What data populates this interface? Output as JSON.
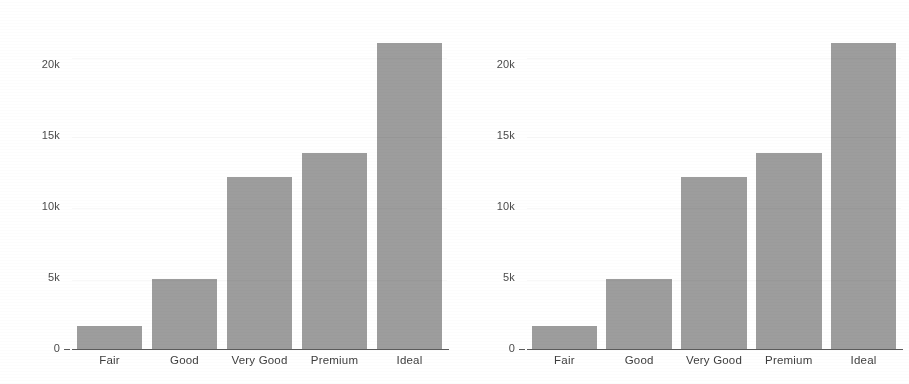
{
  "figure": {
    "background_color": "#ffffff",
    "bar_color": "#9d9d9d",
    "axis_color": "#5a5a5a",
    "text_color": "#3d3d3d",
    "panel_count": 2
  },
  "chart_data": [
    {
      "type": "bar",
      "title": "",
      "subtitle": "",
      "xlabel": "",
      "ylabel": "",
      "categories": [
        "Fair",
        "Good",
        "Very Good",
        "Premium",
        "Ideal"
      ],
      "values": [
        1610,
        4900,
        12100,
        13790,
        21550
      ],
      "series": [
        {
          "name": "count",
          "values": [
            1610,
            4900,
            12100,
            13790,
            21550
          ]
        }
      ],
      "ylim": [
        0,
        23000
      ],
      "yticks": [
        0,
        5000,
        10000,
        15000,
        20000
      ],
      "ytick_labels": [
        "0",
        "5k",
        "10k",
        "15k",
        "20k"
      ],
      "grid": false,
      "legend": "none",
      "orientation": "vertical"
    },
    {
      "type": "bar",
      "title": "",
      "subtitle": "",
      "xlabel": "",
      "ylabel": "",
      "categories": [
        "Fair",
        "Good",
        "Very Good",
        "Premium",
        "Ideal"
      ],
      "values": [
        1610,
        4900,
        12100,
        13790,
        21550
      ],
      "series": [
        {
          "name": "count",
          "values": [
            1610,
            4900,
            12100,
            13790,
            21550
          ]
        }
      ],
      "ylim": [
        0,
        23000
      ],
      "yticks": [
        0,
        5000,
        10000,
        15000,
        20000
      ],
      "ytick_labels": [
        "0",
        "5k",
        "10k",
        "15k",
        "20k"
      ],
      "grid": false,
      "legend": "none",
      "orientation": "vertical"
    }
  ]
}
